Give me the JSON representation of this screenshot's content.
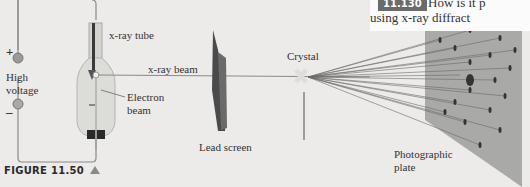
{
  "figure": {
    "caption": "FIGURE 11.50",
    "caption_marker": "triangle-icon"
  },
  "question": {
    "number": "11.130",
    "line1": "How is it p",
    "line2": "using x-ray diffract"
  },
  "labels": {
    "plus": "+",
    "minus": "–",
    "high_voltage_line1": "High",
    "high_voltage_line2": "voltage",
    "xray_tube": "x-ray tube",
    "xray_beam": "x-ray beam",
    "electron_line1": "Electron",
    "electron_line2": "beam",
    "lead_screen": "Lead screen",
    "crystal": "Crystal",
    "photo_line1": "Photographic",
    "photo_line2": "plate"
  },
  "colors": {
    "background": "#ecebe9",
    "wire": "#8a8a8a",
    "tube_glass": "#d8d8d4",
    "lead_screen": "#4a4a4a",
    "plate": "#a9a9a7",
    "spot": "#3a3a3a",
    "question_badge": "#6b6b6b"
  }
}
